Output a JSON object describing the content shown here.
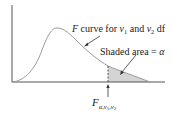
{
  "diagram": {
    "type": "F-distribution density curve",
    "curve_label": {
      "prefix_italic": "F",
      "text": " curve for ",
      "nu1": "ν",
      "nu1_sub": "1",
      "and": " and ",
      "nu2": "ν",
      "nu2_sub": "2",
      "suffix": " df"
    },
    "shaded_label": {
      "text": "Shaded area = ",
      "symbol": "α"
    },
    "critical_value_label": {
      "main": "F",
      "subscript": "α,ν",
      "sub1": "1",
      "comma": ",ν",
      "sub2": "2"
    },
    "colors": {
      "curve": "#9a9a9a",
      "axes": "#555555",
      "shade": "#d4d4d4",
      "text": "#222222"
    }
  }
}
